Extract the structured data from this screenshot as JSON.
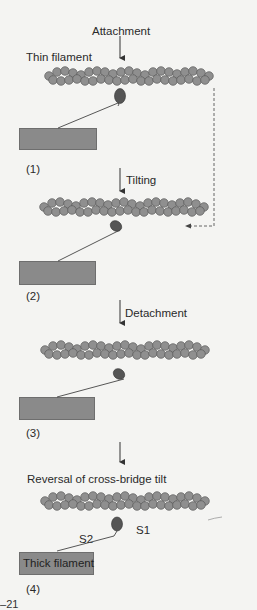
{
  "labels": {
    "attachment": "Attachment",
    "thin_filament": "Thin filament",
    "tilting": "Tilting",
    "detachment": "Detachment",
    "reversal": "Reversal of cross-bridge tilt",
    "s1": "S1",
    "s2": "S2",
    "thick_filament": "Thick filament",
    "figure_number": "6–21"
  },
  "stages": [
    {
      "number": "(1)",
      "step": "Attachment"
    },
    {
      "number": "(2)",
      "step": "Tilting"
    },
    {
      "number": "(3)",
      "step": "Detachment"
    },
    {
      "number": "(4)",
      "step": "Reversal of cross-bridge tilt"
    }
  ],
  "colors": {
    "background": "#f4f4f2",
    "actin_bead": "#8f8f8f",
    "actin_outline": "#5a5a5a",
    "myosin_head": "#555555",
    "thick_filament": "#8a8a8a",
    "text": "#2a2a2a"
  }
}
